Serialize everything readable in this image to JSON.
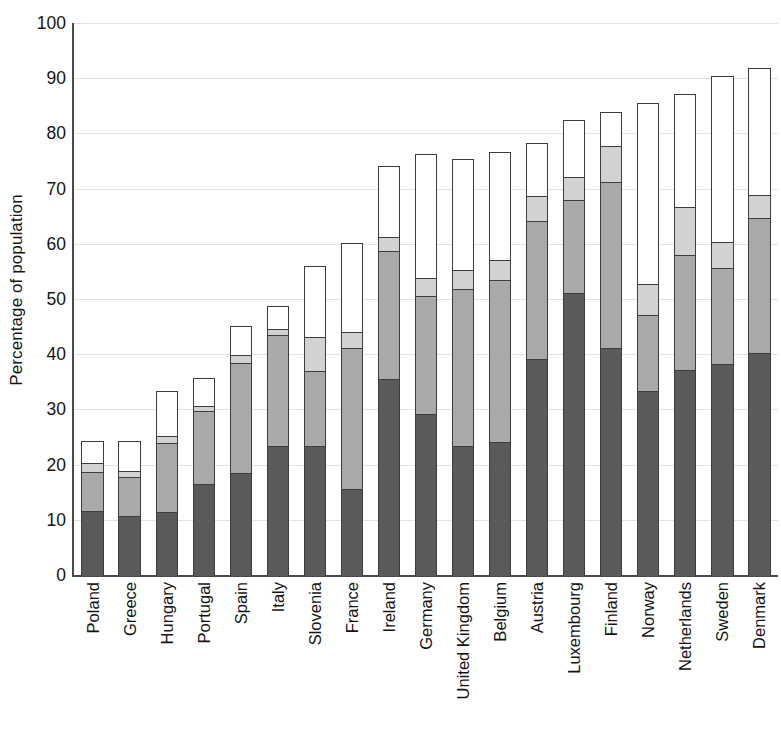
{
  "chart_data": {
    "type": "bar",
    "stacked": true,
    "title": "",
    "xlabel": "",
    "ylabel": "Percentage of population",
    "ylim": [
      0,
      100
    ],
    "ytick_labels": [
      "0",
      "10",
      "20",
      "30",
      "40",
      "50",
      "60",
      "70",
      "80",
      "90",
      "100"
    ],
    "yticks": [
      0,
      10,
      20,
      30,
      40,
      50,
      60,
      70,
      80,
      90,
      100
    ],
    "grid": true,
    "legend": "none",
    "categories": [
      "Poland",
      "Greece",
      "Hungary",
      "Portugal",
      "Spain",
      "Italy",
      "Slovenia",
      "France",
      "Ireland",
      "Germany",
      "United Kingdom",
      "Belgium",
      "Austria",
      "Luxembourg",
      "Finland",
      "Norway",
      "Netherlands",
      "Sweden",
      "Denmark"
    ],
    "series": [
      {
        "name": "segment-1",
        "color": "#5a5a5a",
        "values": [
          11.9,
          11.0,
          11.6,
          16.8,
          18.7,
          23.6,
          23.6,
          15.8,
          35.8,
          29.5,
          23.6,
          24.3,
          39.4,
          51.4,
          41.4,
          33.6,
          37.4,
          38.5,
          40.5
        ]
      },
      {
        "name": "segment-2",
        "color": "#a9a9a9",
        "values": [
          7.0,
          7.0,
          12.7,
          13.3,
          20.0,
          20.3,
          13.6,
          25.6,
          23.2,
          21.4,
          28.5,
          29.4,
          25.0,
          16.9,
          30.2,
          13.7,
          20.8,
          17.5,
          24.4
        ]
      },
      {
        "name": "segment-3",
        "color": "#d2d2d2",
        "values": [
          1.7,
          1.2,
          1.2,
          0.8,
          1.5,
          1.1,
          6.2,
          2.9,
          2.6,
          3.2,
          3.5,
          3.6,
          4.6,
          4.2,
          6.5,
          5.8,
          8.8,
          4.7,
          4.2
        ]
      },
      {
        "name": "segment-4",
        "color": "#ffffff",
        "values": [
          3.8,
          5.2,
          8.0,
          5.0,
          5.1,
          3.9,
          12.8,
          16.1,
          12.7,
          22.3,
          19.9,
          19.5,
          9.4,
          10.1,
          5.9,
          32.6,
          20.4,
          29.8,
          23.0
        ]
      }
    ],
    "totals": [
      24.4,
      24.4,
      33.5,
      35.9,
      45.3,
      48.9,
      56.2,
      60.4,
      74.3,
      76.4,
      75.5,
      76.8,
      78.4,
      82.6,
      84.0,
      85.7,
      87.4,
      90.5,
      92.1
    ]
  },
  "colors": {
    "segment_1": "#5a5a5a",
    "segment_2": "#a9a9a9",
    "segment_3": "#d2d2d2",
    "segment_4": "#ffffff",
    "axis": "#4a4a4a",
    "grid": "#e2e2e2",
    "text": "#141414"
  }
}
